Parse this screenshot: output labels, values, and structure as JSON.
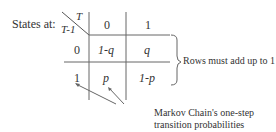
{
  "title_label": "States at:",
  "header": {
    "corner_col": "T",
    "corner_row": "T-1",
    "columns": [
      "0",
      "1"
    ]
  },
  "rows": [
    {
      "state": "0",
      "cells": [
        "1-q",
        "q"
      ]
    },
    {
      "state": "1",
      "cells": [
        "p",
        "1-p"
      ]
    }
  ],
  "brace_annotation": "Rows must add up to 1",
  "arrow_annotation": {
    "line1": "Markov Chain's one-step",
    "line2": "transition probabilities"
  }
}
